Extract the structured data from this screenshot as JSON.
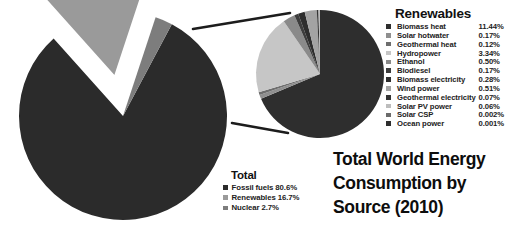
{
  "figure": {
    "title_lines": [
      "Total World Energy",
      "Consumption by",
      "Source (2010)"
    ],
    "background": "#ffffff"
  },
  "total_legend": {
    "title": "Total",
    "items": [
      {
        "label": "Fossil fuels 80.6%",
        "color": "#2b2b2b"
      },
      {
        "label": "Renewables 16.7%",
        "color": "#9a9a9a"
      },
      {
        "label": "Nuclear 2.7%",
        "color": "#7d7d7d"
      }
    ]
  },
  "renewables_legend": {
    "title": "Renewables",
    "items": [
      {
        "label": "Biomass heat",
        "value": "11.44%",
        "color": "#2e2e2e"
      },
      {
        "label": "Solar hotwater",
        "value": "0.17%",
        "color": "#8f8f8f"
      },
      {
        "label": "Geothermal heat",
        "value": "0.12%",
        "color": "#6d6d6d"
      },
      {
        "label": "Hydropower",
        "value": "3.34%",
        "color": "#c6c6c6"
      },
      {
        "label": "Ethanol",
        "value": "0.50%",
        "color": "#8a8a8a"
      },
      {
        "label": "Biodiesel",
        "value": "0.17%",
        "color": "#3d3d3d"
      },
      {
        "label": "Biomass electricity",
        "value": "0.28%",
        "color": "#2e2e2e"
      },
      {
        "label": "Wind power",
        "value": "0.51%",
        "color": "#a3a3a3"
      },
      {
        "label": "Geothermal electricity",
        "value": "0.07%",
        "color": "#333333"
      },
      {
        "label": "Solar PV power",
        "value": "0.06%",
        "color": "#bdbdbd"
      },
      {
        "label": "Solar CSP",
        "value": "0.002%",
        "color": "#6b6b6b"
      },
      {
        "label": "Ocean power",
        "value": "0.001%",
        "color": "#2e2e2e"
      }
    ]
  },
  "chart_data": [
    {
      "type": "pie",
      "name": "total-world-energy-pie",
      "title": "Total",
      "unit": "%",
      "exploded_slice": "Renewables",
      "categories": [
        "Fossil fuels",
        "Renewables",
        "Nuclear"
      ],
      "values": [
        80.6,
        16.7,
        2.7
      ],
      "colors": [
        "#2b2b2b",
        "#9a9a9a",
        "#7d7d7d"
      ],
      "legend_position": "bottom-right"
    },
    {
      "type": "pie",
      "name": "renewables-detail-pie",
      "title": "Renewables",
      "unit": "%",
      "note": "breakout of the 16.7% Renewables slice; values are shares of total world energy",
      "categories": [
        "Biomass heat",
        "Solar hotwater",
        "Geothermal heat",
        "Hydropower",
        "Ethanol",
        "Biodiesel",
        "Biomass electricity",
        "Wind power",
        "Geothermal electricity",
        "Solar PV power",
        "Solar CSP",
        "Ocean power"
      ],
      "values": [
        11.44,
        0.17,
        0.12,
        3.34,
        0.5,
        0.17,
        0.28,
        0.51,
        0.07,
        0.06,
        0.002,
        0.001
      ],
      "colors": [
        "#2e2e2e",
        "#8f8f8f",
        "#6d6d6d",
        "#c6c6c6",
        "#8a8a8a",
        "#3d3d3d",
        "#2e2e2e",
        "#a3a3a3",
        "#333333",
        "#bdbdbd",
        "#6b6b6b",
        "#2e2e2e"
      ],
      "legend_position": "right"
    }
  ]
}
